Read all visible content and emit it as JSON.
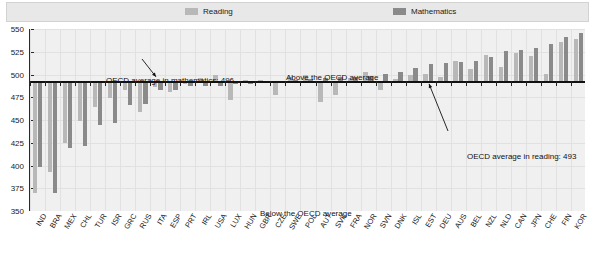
{
  "legend": {
    "items": [
      {
        "label": "Reading",
        "color": "#b8b8b8",
        "name": "legend-item-reading"
      },
      {
        "label": "Mathematics",
        "color": "#8a8a8a",
        "name": "legend-item-mathematics"
      }
    ]
  },
  "annotations": {
    "math_average": "OECD average in mathematics: 496",
    "reading_average": "OECD average in reading: 493",
    "above": "Above the OECD average",
    "below": "Below the OECD average"
  },
  "colors": {
    "reading": "#b8b8b8",
    "mathematics": "#8a8a8a",
    "baseline": "#111111",
    "plot_background": "#f0f0f0",
    "gridline": "#e1e1e1",
    "legend_background": "#e8e8e8"
  },
  "chart_data": {
    "type": "bar",
    "title": "",
    "subtitle": "",
    "xlabel": "",
    "ylabel": "",
    "ylim": [
      350,
      550
    ],
    "yticks": [
      350,
      375,
      400,
      425,
      450,
      475,
      500,
      525,
      550
    ],
    "ytick_labels": [
      "350",
      "375",
      "400",
      "425",
      "450",
      "475",
      "500",
      "525",
      "550"
    ],
    "grid": true,
    "legend_position": "top",
    "baseline_reading": 493,
    "baseline_mathematics": 496,
    "categories": [
      "IND",
      "BRA",
      "MEX",
      "CHL",
      "TUR",
      "ISR",
      "GRC",
      "RUS",
      "ITA",
      "ESP",
      "PRT",
      "IRL",
      "USA",
      "LUX",
      "HUN",
      "GBR",
      "CZE",
      "SWE",
      "POL",
      "AUT",
      "SVK",
      "FRA",
      "NOR",
      "SVN",
      "DNK",
      "ISL",
      "EST",
      "DEU",
      "AUS",
      "BEL",
      "NZL",
      "NLD",
      "CAN",
      "JPN",
      "CHE",
      "FIN",
      "KOR"
    ],
    "series": [
      {
        "name": "Reading",
        "color": "#b8b8b8",
        "values": [
          370,
          393,
          425,
          449,
          464,
          474,
          483,
          459,
          486,
          481,
          489,
          496,
          500,
          472,
          494,
          494,
          478,
          497,
          500,
          470,
          477,
          496,
          503,
          483,
          495,
          500,
          501,
          497,
          515,
          506,
          521,
          508,
          524,
          520,
          501,
          536,
          539
        ]
      },
      {
        "name": "Mathematics",
        "color": "#8a8a8a",
        "values": [
          398,
          370,
          419,
          421,
          445,
          447,
          466,
          468,
          483,
          483,
          487,
          487,
          487,
          489,
          490,
          492,
          493,
          494,
          495,
          496,
          497,
          497,
          498,
          501,
          503,
          507,
          512,
          513,
          514,
          515,
          519,
          526,
          527,
          529,
          534,
          541,
          546
        ]
      }
    ]
  }
}
